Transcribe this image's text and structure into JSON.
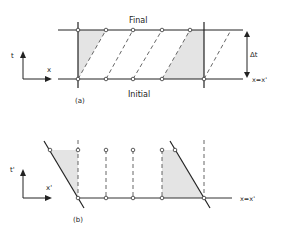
{
  "panel_a": {
    "label": "(a)",
    "top_label": "Final",
    "bottom_label": "Initial",
    "interval_label": "Δt",
    "axis_x_label": "x",
    "axis_t_label": "t",
    "line_label": "x=x'"
  },
  "panel_b": {
    "label": "(b)",
    "axis_x_label": "x'",
    "axis_t_label": "t'",
    "line_label": "x=x'"
  },
  "colors": {
    "line": "#222222",
    "dashed": "#555555",
    "shade": "#e4e4e4"
  }
}
